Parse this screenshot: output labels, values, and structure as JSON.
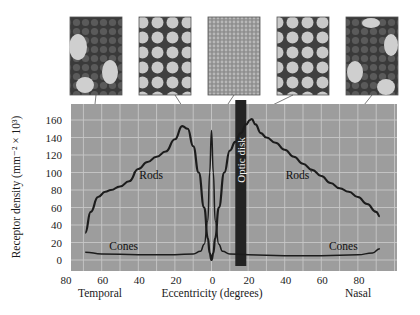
{
  "chart_data": {
    "type": "line",
    "title": "",
    "xlabel": "Eccentricity (degrees)",
    "ylabel": "Receptor density (mm⁻² × 10³)",
    "x_side_labels": {
      "left": "Temporal",
      "right": "Nasal"
    },
    "xlim": [
      -80,
      100
    ],
    "ylim": [
      0,
      180
    ],
    "x_ticks": [
      -80,
      -60,
      -40,
      -20,
      0,
      20,
      40,
      60,
      80
    ],
    "x_tick_labels": [
      "80",
      "60",
      "40",
      "20",
      "0",
      "20",
      "40",
      "60",
      "80"
    ],
    "y_ticks": [
      0,
      20,
      40,
      60,
      80,
      100,
      120,
      140,
      160
    ],
    "y_tick_labels": [
      "0",
      "20",
      "40",
      "60",
      "80",
      "100",
      "120",
      "140",
      "160"
    ],
    "grid": true,
    "annotation": {
      "label": "Optic disk",
      "x_start": 13,
      "x_end": 19
    },
    "series": [
      {
        "name": "Rods",
        "x": [
          -69,
          -66,
          -62,
          -58,
          -55,
          -50,
          -45,
          -40,
          -35,
          -30,
          -25,
          -20,
          -16,
          -13,
          -10,
          -7,
          -4,
          -2,
          -1,
          0,
          1,
          2,
          4,
          7,
          10,
          13,
          16,
          19,
          21,
          22,
          24,
          27,
          30,
          35,
          40,
          45,
          50,
          55,
          60,
          65,
          70,
          75,
          80,
          85,
          90,
          92
        ],
        "y": [
          31,
          55,
          72,
          78,
          80,
          84,
          90,
          104,
          112,
          118,
          124,
          138,
          153,
          150,
          130,
          100,
          60,
          25,
          8,
          0,
          8,
          25,
          60,
          100,
          125,
          135,
          145,
          155,
          160,
          161,
          155,
          145,
          140,
          134,
          126,
          118,
          110,
          103,
          96,
          88,
          82,
          78,
          72,
          64,
          55,
          50
        ]
      },
      {
        "name": "Cones",
        "x": [
          -69,
          -60,
          -40,
          -20,
          -10,
          -6,
          -4,
          -2,
          -1,
          0,
          1,
          2,
          4,
          6,
          10,
          20,
          40,
          60,
          80,
          88,
          92
        ],
        "y": [
          9,
          7,
          6,
          6,
          7,
          10,
          18,
          45,
          100,
          148,
          100,
          45,
          18,
          10,
          7,
          6,
          5,
          5,
          6,
          8,
          13
        ]
      }
    ],
    "curve_labels": [
      {
        "text": "Rods",
        "x": -33,
        "y": 93
      },
      {
        "text": "Rods",
        "x": 47,
        "y": 93
      },
      {
        "text": "Cones",
        "x": -48,
        "y": 12
      },
      {
        "text": "Cones",
        "x": 72,
        "y": 12
      }
    ],
    "colors": {
      "plot_bg": "#9d9d9d",
      "grid": "#c7c7c7",
      "curve": "#1c1c1c",
      "optic_disk": "#232323"
    },
    "inset_images": [
      {
        "label": "temporal-periphery-mosaic",
        "x_deg": -69,
        "y_value": 77,
        "tone": "dark"
      },
      {
        "label": "temporal-parafovea-mosaic",
        "x_deg": -5,
        "y_value": 140,
        "tone": "light"
      },
      {
        "label": "fovea-cone-mosaic",
        "x_deg": 0,
        "y_value": 150,
        "tone": "fine"
      },
      {
        "label": "nasal-parafovea-mosaic",
        "x_deg": 5,
        "y_value": 148,
        "tone": "light"
      },
      {
        "label": "nasal-periphery-mosaic",
        "x_deg": 55,
        "y_value": 103,
        "tone": "dark"
      }
    ]
  },
  "axis": {
    "ylabel": "Receptor density (mm⁻² × 10³)",
    "xlabel": "Eccentricity (degrees)",
    "temporal": "Temporal",
    "nasal": "Nasal",
    "optic_disk": "Optic disk"
  }
}
